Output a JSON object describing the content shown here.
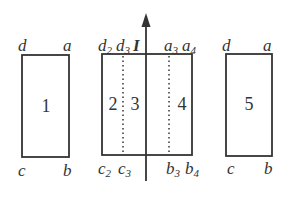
{
  "diagram": {
    "colors": {
      "stroke": "#333333",
      "background": "#ffffff"
    },
    "wire": {
      "current_label": "I",
      "direction": "up"
    },
    "loops": [
      {
        "id": "1",
        "label": "1",
        "corners": {
          "top_left": "d",
          "top_right": "a",
          "bottom_left": "c",
          "bottom_right": "b"
        }
      },
      {
        "id": "2",
        "label": "2"
      },
      {
        "id": "3",
        "label": "3"
      },
      {
        "id": "4",
        "label": "4"
      },
      {
        "id": "5",
        "label": "5",
        "corners": {
          "top_left": "d",
          "top_right": "a",
          "bottom_left": "c",
          "bottom_right": "b"
        }
      }
    ],
    "center_corners": {
      "d2": {
        "base": "d",
        "sub": "2"
      },
      "d3": {
        "base": "d",
        "sub": "3"
      },
      "a3": {
        "base": "a",
        "sub": "3"
      },
      "a4": {
        "base": "a",
        "sub": "4"
      },
      "c2": {
        "base": "c",
        "sub": "2"
      },
      "c3": {
        "base": "c",
        "sub": "3"
      },
      "b3": {
        "base": "b",
        "sub": "3"
      },
      "b4": {
        "base": "b",
        "sub": "4"
      }
    }
  }
}
